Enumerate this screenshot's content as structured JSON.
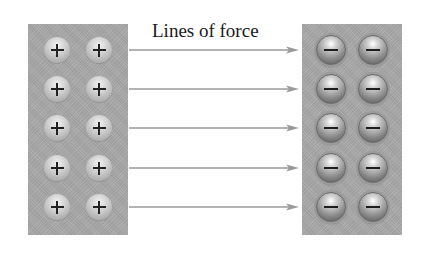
{
  "diagram": {
    "title": "Lines of force",
    "left_plate": {
      "charge": "positive",
      "symbol": "+",
      "rows": 5,
      "columns": 2,
      "color": "#a9a9a9"
    },
    "right_plate": {
      "charge": "negative",
      "symbol": "−",
      "rows": 5,
      "columns": 2,
      "color": "#a9a9a9"
    },
    "arrows": {
      "count": 5,
      "direction": "left-to-right",
      "color": "#9a9a9a"
    },
    "row_y": [
      50,
      89,
      128,
      168,
      207
    ],
    "left_ball_x": [
      57,
      99
    ],
    "right_ball_x": [
      331,
      373
    ]
  }
}
